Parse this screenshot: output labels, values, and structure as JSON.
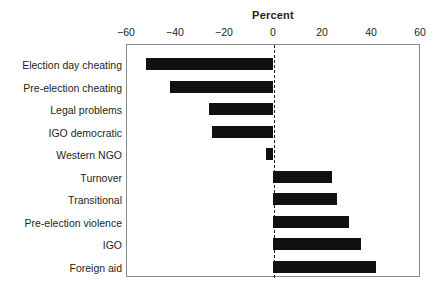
{
  "chart_data": {
    "type": "bar",
    "orientation": "horizontal",
    "title": "Percent",
    "xlabel": "Percent",
    "ylabel": "",
    "xlim": [
      -60,
      60
    ],
    "xticks": [
      -60,
      -40,
      -20,
      0,
      20,
      40,
      60
    ],
    "xtick_labels": [
      "−60",
      "−40",
      "−20",
      "0",
      "20",
      "40",
      "60"
    ],
    "grid": false,
    "legend": null,
    "zero_reference_line": true,
    "bar_color": "#111111",
    "frame_color": "#8a8a8a",
    "categories": [
      "Election day cheating",
      "Pre-election cheating",
      "Legal problems",
      "IGO democratic",
      "Western NGO",
      "Turnover",
      "Transitional",
      "Pre-election violence",
      "IGO",
      "Foreign aid"
    ],
    "values": [
      -52,
      -42,
      -26,
      -25,
      -3,
      24,
      26,
      31,
      36,
      42
    ]
  }
}
